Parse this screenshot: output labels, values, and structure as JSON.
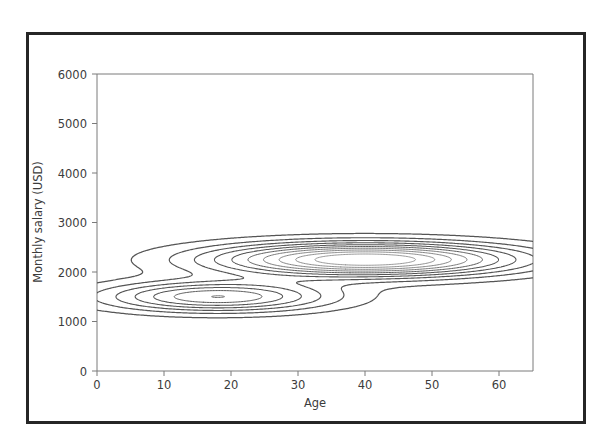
{
  "figure": {
    "background_color": "#ffffff",
    "frame_color": "#262626",
    "axis_color": "#7a7a7a",
    "contour_color": "#555555",
    "text_color": "#3c3c3c"
  },
  "chart_data": {
    "type": "contour",
    "title": "",
    "subtitle": "",
    "xlabel": "Age",
    "ylabel": "Monthly salary (USD)",
    "xlim": [
      0,
      65
    ],
    "ylim": [
      0,
      6000
    ],
    "xticks": [
      0,
      10,
      20,
      30,
      40,
      50,
      60
    ],
    "xticklabels": [
      "0",
      "10",
      "20",
      "30",
      "40",
      "50",
      "60"
    ],
    "yticks": [
      0,
      1000,
      2000,
      3000,
      4000,
      5000,
      6000
    ],
    "yticklabels": [
      "0",
      "1000",
      "2000",
      "3000",
      "4000",
      "5000",
      "6000"
    ],
    "grid": false,
    "legend": null,
    "annotations": [],
    "n_levels": 10,
    "modes": [
      {
        "name": "young-low-salary-mode",
        "center_x": 18,
        "center_y": 1500,
        "peak_relative_density": 0.62,
        "x_extent": [
          2,
          47
        ],
        "y_extent": [
          1150,
          1850
        ]
      },
      {
        "name": "midcareer-high-salary-mode",
        "center_x": 40,
        "center_y": 2250,
        "peak_relative_density": 1.0,
        "x_extent": [
          11,
          65
        ],
        "y_extent": [
          1850,
          2700
        ]
      }
    ],
    "levels": [
      0.08,
      0.17,
      0.26,
      0.35,
      0.44,
      0.53,
      0.62,
      0.71,
      0.8,
      0.89
    ]
  },
  "axes": {
    "x_axis_name": "age-axis",
    "y_axis_name": "salary-axis"
  }
}
